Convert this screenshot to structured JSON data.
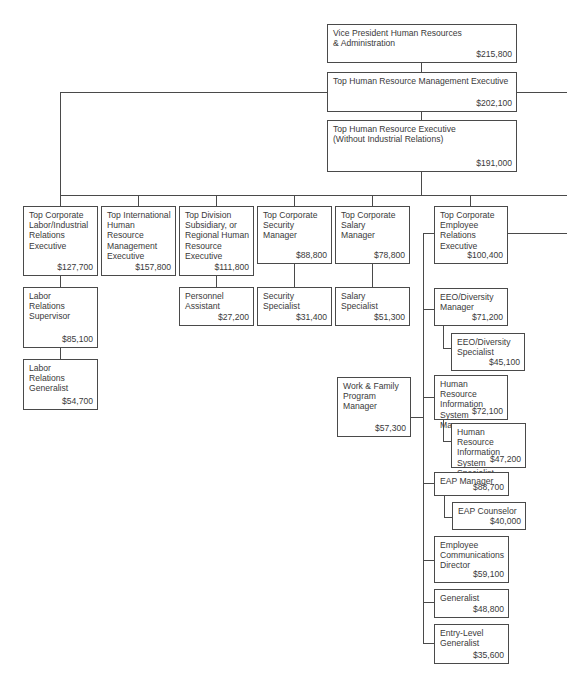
{
  "chart_title": "",
  "colors": {
    "line": "#4a4a4a",
    "text": "#3a3a3a",
    "background": "#ffffff"
  },
  "nodes": {
    "vp": {
      "title": "Vice President Human Resources\n& Administration",
      "salary": "$215,800"
    },
    "top_hrm": {
      "title": "Top Human Resource Management Executive",
      "salary": "$202,100"
    },
    "top_hr_noir": {
      "title": "Top Human Resource Executive\n(Without Industrial Relations)",
      "salary": "$191,000"
    },
    "labor_exec": {
      "title": "Top Corporate\nLabor/Industrial\nRelations\nExecutive",
      "salary": "$127,700"
    },
    "intl_exec": {
      "title": "Top International\nHuman\nResource\nManagement\nExecutive",
      "salary": "$157,800"
    },
    "division_exec": {
      "title": "Top Division\nSubsidiary, or\nRegional Human\nResource\nExecutive",
      "salary": "$111,800"
    },
    "security_mgr": {
      "title": "Top Corporate\nSecurity\nManager",
      "salary": "$88,800"
    },
    "salary_mgr": {
      "title": "Top Corporate\nSalary\nManager",
      "salary": "$78,800"
    },
    "employee_rel_exec": {
      "title": "Top Corporate\nEmployee\nRelations\nExecutive",
      "salary": "$100,400"
    },
    "labor_supervisor": {
      "title": "Labor\nRelations\nSupervisor",
      "salary": "$85,100"
    },
    "labor_generalist": {
      "title": "Labor\nRelations\nGeneralist",
      "salary": "$54,700"
    },
    "personnel_assistant": {
      "title": "Personnel\nAssistant",
      "salary": "$27,200"
    },
    "security_specialist": {
      "title": "Security\nSpecialist",
      "salary": "$31,400"
    },
    "salary_specialist": {
      "title": "Salary\nSpecialist",
      "salary": "$51,300"
    },
    "eeo_manager": {
      "title": "EEO/Diversity\nManager",
      "salary": "$71,200"
    },
    "eeo_specialist": {
      "title": "EEO/Diversity\nSpecialist",
      "salary": "$45,100"
    },
    "work_family": {
      "title": "Work & Family\nProgram\nManager",
      "salary": "$57,300"
    },
    "hris_manager": {
      "title": "Human Resource\nInformation\nSystem Manager",
      "salary": "$72,100"
    },
    "hris_specialist": {
      "title": "Human Resource\nInformation\nSystem Specialist",
      "salary": "$47,200"
    },
    "eap_manager": {
      "title": "EAP Manager",
      "salary": "$88,700"
    },
    "eap_counselor": {
      "title": "EAP Counselor",
      "salary": "$40,000"
    },
    "emp_comm_director": {
      "title": "Employee\nCommunications\nDirector",
      "salary": "$59,100"
    },
    "generalist": {
      "title": "Generalist",
      "salary": "$48,800"
    },
    "entry_generalist": {
      "title": "Entry-Level\nGeneralist",
      "salary": "$35,600"
    }
  }
}
